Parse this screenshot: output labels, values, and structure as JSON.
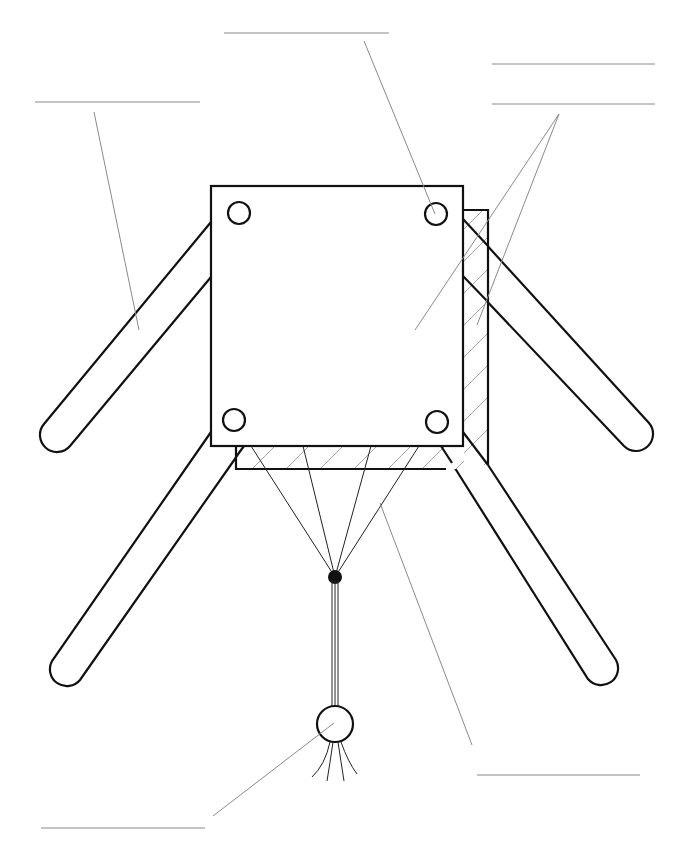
{
  "diagram": {
    "colors": {
      "stroke": "#111111",
      "leader": "#8a8a8a",
      "hatch": "#9a9a9a",
      "background": "#ffffff"
    },
    "labels": [
      {
        "id": "label-top-left",
        "text": ""
      },
      {
        "id": "label-top-center",
        "text": ""
      },
      {
        "id": "label-top-right-1",
        "text": ""
      },
      {
        "id": "label-top-right-2",
        "text": ""
      },
      {
        "id": "label-bottom-right",
        "text": ""
      },
      {
        "id": "label-bottom-left",
        "text": ""
      }
    ]
  }
}
